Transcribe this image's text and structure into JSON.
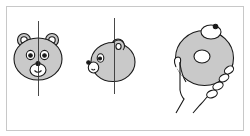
{
  "figure": {
    "colors": {
      "background": "#ffffff",
      "frame": "#c8c8c8",
      "fill": "#c9c9c9",
      "stroke": "#1a1a1a",
      "axis": "#333333"
    },
    "panels": [
      {
        "name": "bear-front-view"
      },
      {
        "name": "bear-side-view"
      },
      {
        "name": "donut-in-hand"
      }
    ]
  }
}
